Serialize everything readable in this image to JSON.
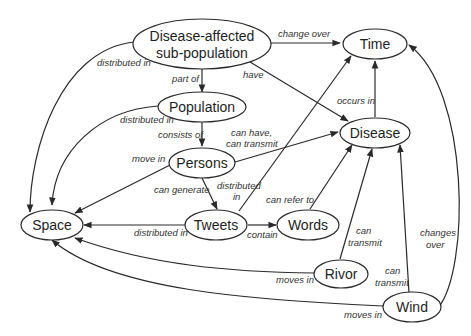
{
  "diagram": {
    "type": "concept-graph",
    "nodes": {
      "dasp": {
        "line1": "Disease-affected",
        "line2": "sub-population"
      },
      "time": {
        "label": "Time"
      },
      "population": {
        "label": "Population"
      },
      "disease": {
        "label": "Disease"
      },
      "persons": {
        "label": "Persons"
      },
      "space": {
        "label": "Space"
      },
      "tweets": {
        "label": "Tweets"
      },
      "words": {
        "label": "Words"
      },
      "rivor": {
        "label": "Rivor"
      },
      "wind": {
        "label": "Wind"
      }
    },
    "edges": {
      "dasp_time": "change over",
      "dasp_population": "part of",
      "dasp_disease": "have",
      "dasp_space": "distributed in",
      "population_space": "distributed in",
      "population_persons": "consists of",
      "persons_disease_1": "can have,",
      "persons_disease_2": "can transmit",
      "persons_space": "move in",
      "persons_tweets": "can generate",
      "tweets_time_1": "distributed",
      "tweets_time_2": "in",
      "disease_time": "occurs in",
      "tweets_space": "distributed in",
      "tweets_words": "contain",
      "words_disease": "can refer to",
      "rivor_disease_1": "can",
      "rivor_disease_2": "transmit",
      "rivor_space": "moves in",
      "wind_disease_1": "can",
      "wind_disease_2": "transmit",
      "wind_time_1": "changes",
      "wind_time_2": "over",
      "wind_space": "moves in"
    }
  }
}
